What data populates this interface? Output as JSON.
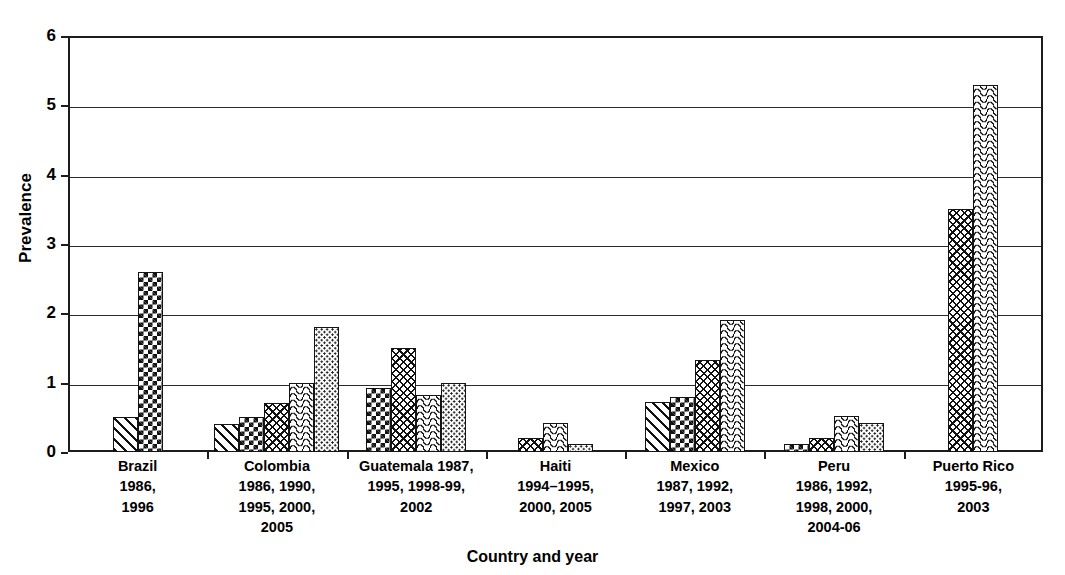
{
  "chart_data": {
    "type": "bar",
    "title": "",
    "xlabel": "Country and year",
    "ylabel": "Prevalence",
    "ylim": [
      0,
      6
    ],
    "ytick_labels": [
      "0",
      "1",
      "2",
      "3",
      "4",
      "5",
      "6"
    ],
    "ytick_values": [
      0,
      1,
      2,
      3,
      4,
      5,
      6
    ],
    "grid": true,
    "legend": "none",
    "categories": [
      "Brazil\n1986,\n1996",
      "Colombia\n1986, 1990,\n1995, 2000,\n2005",
      "Guatemala 1987,\n1995, 1998-99,\n2002",
      "Haiti\n1994–1995,\n2000, 2005",
      "Mexico\n1987, 1992,\n1997, 2003",
      "Peru\n1986, 1992,\n1998, 2000,\n2004-06",
      "Puerto Rico\n1995-96,\n2003"
    ],
    "groups": [
      {
        "name": "Brazil",
        "years": "1986, 1996",
        "bars": [
          {
            "pattern": "diagonal-hatch",
            "value": 0.5
          },
          {
            "pattern": "checkerboard",
            "value": 2.6
          }
        ]
      },
      {
        "name": "Colombia",
        "years": "1986, 1990, 1995, 2000, 2005",
        "bars": [
          {
            "pattern": "diagonal-hatch",
            "value": 0.4
          },
          {
            "pattern": "checkerboard",
            "value": 0.5
          },
          {
            "pattern": "crosshatch",
            "value": 0.7
          },
          {
            "pattern": "wavy",
            "value": 1.0
          },
          {
            "pattern": "dotted",
            "value": 1.8
          }
        ]
      },
      {
        "name": "Guatemala",
        "years": "1987, 1995, 1998-99, 2002",
        "bars": [
          {
            "pattern": "checkerboard",
            "value": 0.92
          },
          {
            "pattern": "crosshatch",
            "value": 1.5
          },
          {
            "pattern": "wavy",
            "value": 0.82
          },
          {
            "pattern": "dotted",
            "value": 1.0
          }
        ]
      },
      {
        "name": "Haiti",
        "years": "1994–1995, 2000, 2005",
        "bars": [
          {
            "pattern": "crosshatch",
            "value": 0.2
          },
          {
            "pattern": "wavy",
            "value": 0.42
          },
          {
            "pattern": "dotted",
            "value": 0.12
          }
        ]
      },
      {
        "name": "Mexico",
        "years": "1987, 1992, 1997, 2003",
        "bars": [
          {
            "pattern": "diagonal-hatch",
            "value": 0.72
          },
          {
            "pattern": "checkerboard",
            "value": 0.8
          },
          {
            "pattern": "crosshatch",
            "value": 1.32
          },
          {
            "pattern": "wavy",
            "value": 1.9
          }
        ]
      },
      {
        "name": "Peru",
        "years": "1986, 1992, 1998, 2000, 2004-06",
        "bars": [
          {
            "pattern": "checkerboard",
            "value": 0.12
          },
          {
            "pattern": "crosshatch",
            "value": 0.2
          },
          {
            "pattern": "wavy",
            "value": 0.52
          },
          {
            "pattern": "dotted",
            "value": 0.42
          }
        ]
      },
      {
        "name": "Puerto Rico",
        "years": "1995-96, 2003",
        "bars": [
          {
            "pattern": "crosshatch",
            "value": 3.5
          },
          {
            "pattern": "wavy",
            "value": 5.3
          }
        ]
      }
    ]
  },
  "colors": {
    "axis": "#1c1c1c",
    "gridline": "#2b2b2b",
    "bar_outline": "#141414",
    "background": "#ffffff",
    "pattern_ink": "#111111"
  }
}
